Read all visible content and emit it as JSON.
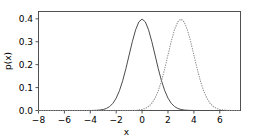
{
  "chart_data": {
    "type": "line",
    "title": "",
    "xlabel": "x",
    "ylabel": "p(x)",
    "xlim": [
      -8,
      7.6
    ],
    "ylim": [
      0.0,
      0.432
    ],
    "grid": false,
    "legend": "none",
    "xticks": [
      -8,
      -6,
      -4,
      -2,
      0,
      2,
      4,
      6
    ],
    "xticklabels": [
      "−8",
      "−6",
      "−4",
      "−2",
      "0",
      "2",
      "4",
      "6"
    ],
    "yticks": [
      0.0,
      0.1,
      0.2,
      0.3,
      0.4
    ],
    "yticklabels": [
      "0.0",
      "0.1",
      "0.2",
      "0.3",
      "0.4"
    ],
    "series": [
      {
        "name": "gaussian-mu-0",
        "style": "solid",
        "color": "#4c4c4c",
        "mean": 0,
        "sigma": 1,
        "peak": 0.3989,
        "x": [
          -8,
          -7.5,
          -7,
          -6.5,
          -6,
          -5.5,
          -5,
          -4.5,
          -4,
          -3.75,
          -3.5,
          -3.25,
          -3,
          -2.75,
          -2.5,
          -2.25,
          -2,
          -1.75,
          -1.5,
          -1.25,
          -1,
          -0.75,
          -0.5,
          -0.25,
          0,
          0.25,
          0.5,
          0.75,
          1,
          1.25,
          1.5,
          1.75,
          2,
          2.25,
          2.5,
          2.75,
          3,
          3.25,
          3.5,
          3.75,
          4,
          4.5,
          5,
          5.5,
          6,
          6.5,
          7,
          7.6
        ],
        "y": [
          0.0,
          0.0,
          0.0,
          0.0,
          0.0,
          0.0,
          0.0,
          0.0,
          0.0001,
          0.0004,
          0.0009,
          0.002,
          0.0044,
          0.0091,
          0.0175,
          0.0317,
          0.054,
          0.0863,
          0.1295,
          0.1826,
          0.242,
          0.3011,
          0.3521,
          0.3867,
          0.3989,
          0.3867,
          0.3521,
          0.3011,
          0.242,
          0.1826,
          0.1295,
          0.0863,
          0.054,
          0.0317,
          0.0175,
          0.0091,
          0.0044,
          0.002,
          0.0009,
          0.0004,
          0.0001,
          0.0,
          0.0,
          0.0,
          0.0,
          0.0,
          0.0,
          0.0
        ]
      },
      {
        "name": "gaussian-mu-3",
        "style": "dotted",
        "color": "#8c8c8c",
        "mean": 3,
        "sigma": 1,
        "peak": 0.3989,
        "x": [
          -8,
          -7,
          -6,
          -5,
          -4,
          -3,
          -2,
          -1,
          -0.5,
          0,
          0.25,
          0.5,
          0.75,
          1,
          1.25,
          1.5,
          1.75,
          2,
          2.25,
          2.5,
          2.75,
          3,
          3.25,
          3.5,
          3.75,
          4,
          4.25,
          4.5,
          4.75,
          5,
          5.25,
          5.5,
          5.75,
          6,
          6.5,
          7,
          7.6
        ],
        "y": [
          0.0,
          0.0,
          0.0,
          0.0,
          0.0,
          0.0,
          0.0,
          0.0001,
          0.0004,
          0.0044,
          0.0091,
          0.0175,
          0.0317,
          0.054,
          0.0863,
          0.1295,
          0.1826,
          0.242,
          0.3011,
          0.3521,
          0.3867,
          0.3989,
          0.3867,
          0.3521,
          0.3011,
          0.242,
          0.1826,
          0.1295,
          0.0863,
          0.054,
          0.0317,
          0.0175,
          0.0091,
          0.0044,
          0.0009,
          0.0001,
          0.0
        ]
      }
    ]
  }
}
